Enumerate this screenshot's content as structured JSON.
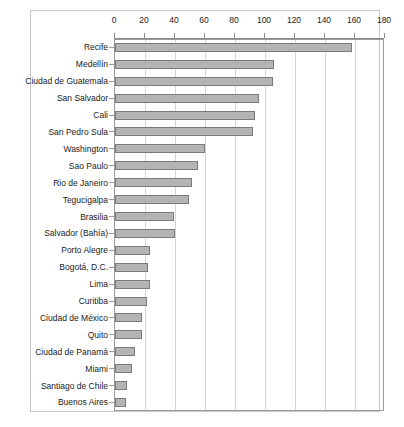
{
  "chart_data": {
    "type": "bar",
    "orientation": "horizontal",
    "title": "",
    "xlabel": "",
    "ylabel": "",
    "xlim": [
      0,
      180
    ],
    "xticks": [
      0,
      20,
      40,
      60,
      80,
      100,
      120,
      140,
      160,
      180
    ],
    "grid": true,
    "legend": null,
    "bar_color": "#b4b4b4",
    "bar_border_color": "#7a7a7a",
    "frame_color": "#c8c8c8",
    "gridline_color": "#d5d5d5",
    "axis_color": "#8c8c8c",
    "categories": [
      "Recife",
      "Medellín",
      "Ciudad de Guatemala",
      "San Salvador",
      "Cali",
      "San Pedro Sula",
      "Washington",
      "Sao Paulo",
      "Rio de Janeiro",
      "Tegucigalpa",
      "Brasilia",
      "Salvador (Bahía)",
      "Porto Alegre",
      "Bogotá, D.C.",
      "Lima",
      "Curitiba",
      "Ciudad de México",
      "Quito",
      "Ciudad de Panamá",
      "Miami",
      "Santiago de Chile",
      "Buenos Aires"
    ],
    "values": [
      158,
      106,
      105,
      96,
      93,
      92,
      60,
      55,
      51,
      49,
      39,
      40,
      23,
      22,
      23,
      21,
      18,
      18,
      13,
      11,
      8,
      7
    ]
  }
}
